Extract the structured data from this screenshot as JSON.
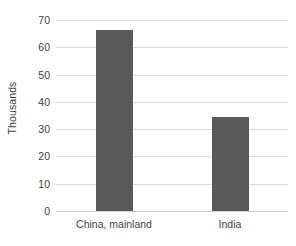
{
  "chart_data": {
    "type": "bar",
    "title": "",
    "xlabel": "",
    "ylabel": "Thousands",
    "categories": [
      "China, mainland",
      "India"
    ],
    "values": [
      66.5,
      34.5
    ],
    "series": [
      {
        "name": "",
        "values": [
          66.5,
          34.5
        ]
      }
    ],
    "ylim": [
      0,
      70
    ],
    "yticks": [
      0,
      10,
      20,
      30,
      40,
      50,
      60,
      70
    ],
    "ytick_labels": [
      "0",
      "10",
      "20",
      "30",
      "40",
      "50",
      "60",
      "70"
    ],
    "grid": true,
    "legend": false,
    "legend_position": "none",
    "bar_color": "#595959",
    "gridline_color": "#d9d9d9",
    "background_color": "#ffffff",
    "text_color": "#3f3f3f"
  }
}
